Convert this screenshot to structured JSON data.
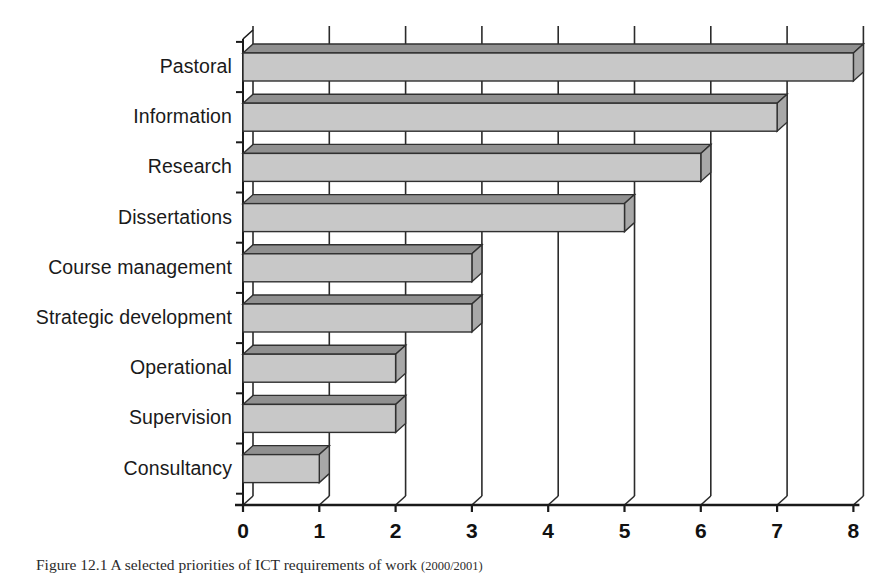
{
  "figure": {
    "caption_prefix": "Figure 12.1",
    "caption_text": "Figure 12.1  A selected priorities of ICT requirements of work",
    "caption_suffix": "(2000/2001)"
  },
  "chart_data": {
    "type": "bar",
    "orientation": "horizontal",
    "style": "3d-extruded-bars",
    "title": "",
    "xlabel": "",
    "ylabel": "",
    "xlim": [
      0,
      8
    ],
    "xticks": [
      "0",
      "1",
      "2",
      "3",
      "4",
      "5",
      "6",
      "7",
      "8"
    ],
    "grid": true,
    "legend": false,
    "categories": [
      "Pastoral",
      "Information",
      "Research",
      "Dissertations",
      "Course management",
      "Strategic development",
      "Operational",
      "Supervision",
      "Consultancy"
    ],
    "values": [
      8,
      7,
      6,
      5,
      3,
      3,
      2,
      2,
      1
    ],
    "colors": {
      "bar_face": "#c8c8c8",
      "bar_top": "#909090",
      "bar_side": "#a8a8a8",
      "bar_outline": "#303030",
      "axis": "#1a1a1a",
      "grid": "#2b2b2b",
      "background": "#ffffff"
    }
  }
}
